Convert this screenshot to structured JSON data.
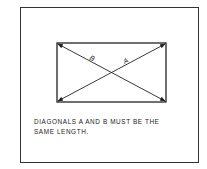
{
  "diagram": {
    "labels": {
      "a": "A",
      "b": "B"
    },
    "caption": {
      "line1": "DIAGONALS A  AND B  MUST BE THE",
      "line2": "SAME LENGTH."
    },
    "rectangle": {
      "x1": 57,
      "y1": 43,
      "x2": 166,
      "y2": 102
    },
    "colors": {
      "line": "#222222",
      "background": "#ffffff"
    }
  }
}
